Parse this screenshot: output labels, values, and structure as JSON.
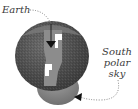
{
  "diagram": {
    "type": "illustration",
    "labels": {
      "earth": "Earth",
      "south_polar_sky_line1": "South",
      "south_polar_sky_line2": "polar",
      "south_polar_sky_line3": "sky"
    },
    "colors": {
      "sphere_dark": "#4a4a4a",
      "sphere_mid": "#6e6e6e",
      "lower_hemisphere": "#8a8a8a",
      "cutout": "#ffffff",
      "arrow": "#111111",
      "leader_line": "#666666",
      "text": "#3a3a3a"
    },
    "icons": {
      "top_arrow": "arrow-down-icon",
      "bottom_arrow": "arrow-left-icon"
    }
  }
}
